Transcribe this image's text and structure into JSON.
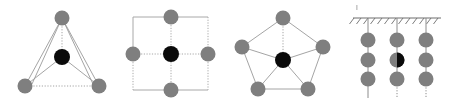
{
  "figure": {
    "title": "",
    "background_color": "#ffffff",
    "width": 449,
    "height": 106,
    "node_color": "#7f7f7f",
    "center_node_color": "#0a0a0a",
    "edge_color": "#9a9a9a",
    "panel_count": 4
  },
  "panels": [
    {
      "id": "panel-triangle",
      "label": "triangle-network",
      "shape": "triangle",
      "outer_node_count": 3,
      "center_node_count": 1,
      "origin_x": 8,
      "node_radius": 7.5,
      "center_radius": 8.0,
      "outer_nodes": [
        {
          "name": "apex",
          "x": 54,
          "y": 18
        },
        {
          "name": "bottom-left",
          "x": 17,
          "y": 86
        },
        {
          "name": "bottom-right",
          "x": 91,
          "y": 86
        }
      ],
      "center_node": {
        "name": "center",
        "x": 54,
        "y": 57
      },
      "solid_edges": [
        [
          54,
          18,
          17,
          86
        ],
        [
          54,
          18,
          91,
          86
        ],
        [
          54,
          18,
          54,
          57
        ],
        [
          54,
          57,
          17,
          86
        ],
        [
          54,
          57,
          91,
          86
        ]
      ],
      "dotted_edges": [
        [
          17,
          86,
          91,
          86
        ]
      ]
    },
    {
      "id": "panel-square",
      "label": "square-lattice-network",
      "shape": "square-grid",
      "outer_node_count": 4,
      "center_node_count": 1,
      "origin_x": 117,
      "node_radius": 7.5,
      "center_radius": 8.0,
      "outer_nodes": [
        {
          "name": "top",
          "x": 54,
          "y": 17
        },
        {
          "name": "left",
          "x": 16,
          "y": 54
        },
        {
          "name": "right",
          "x": 91,
          "y": 54
        },
        {
          "name": "bottom",
          "x": 54,
          "y": 90
        }
      ],
      "center_node": {
        "name": "center",
        "x": 54,
        "y": 54
      },
      "solid_edges": [
        [
          16,
          17,
          91,
          17
        ],
        [
          16,
          17,
          16,
          54
        ],
        [
          54,
          17,
          54,
          54
        ],
        [
          16,
          54,
          54,
          54
        ],
        [
          54,
          54,
          91,
          54
        ],
        [
          16,
          54,
          16,
          90
        ],
        [
          16,
          90,
          91,
          90
        ]
      ],
      "dotted_edges": [
        [
          91,
          17,
          91,
          54
        ],
        [
          91,
          54,
          91,
          90
        ],
        [
          54,
          54,
          54,
          90
        ],
        [
          16,
          90,
          91,
          90
        ],
        [
          16,
          54,
          16,
          90
        ]
      ]
    },
    {
      "id": "panel-pentagon",
      "label": "pentagon-network",
      "shape": "pentagon",
      "outer_node_count": 5,
      "center_node_count": 1,
      "origin_x": 230,
      "node_radius": 7.5,
      "center_radius": 8.0,
      "outer_nodes": [
        {
          "name": "top",
          "x": 53,
          "y": 18
        },
        {
          "name": "upper-left",
          "x": 12,
          "y": 47
        },
        {
          "name": "upper-right",
          "x": 93,
          "y": 47
        },
        {
          "name": "lower-left",
          "x": 28,
          "y": 89
        },
        {
          "name": "lower-right",
          "x": 78,
          "y": 89
        }
      ],
      "center_node": {
        "name": "center",
        "x": 53,
        "y": 60
      },
      "solid_edges": [
        [
          53,
          18,
          12,
          47
        ],
        [
          53,
          18,
          93,
          47
        ],
        [
          12,
          47,
          28,
          89
        ],
        [
          93,
          47,
          78,
          89
        ],
        [
          12,
          47,
          53,
          60
        ],
        [
          93,
          47,
          53,
          60
        ],
        [
          28,
          89,
          53,
          60
        ],
        [
          78,
          89,
          53,
          60
        ],
        [
          28,
          89,
          78,
          89
        ]
      ],
      "dotted_edges": [
        [
          53,
          18,
          53,
          60
        ]
      ]
    },
    {
      "id": "panel-suspended",
      "label": "suspended-chains-with-fixed-support",
      "shape": "hanging-chains",
      "origin_x": 345,
      "node_radius": 7.5,
      "column_count": 3,
      "nodes_per_column": 3,
      "support": {
        "name": "fixed-support-hatching",
        "line_y": 18,
        "line_x1": 8,
        "line_x2": 96,
        "hatch_count": 13,
        "hatch_length": 7
      },
      "columns": [
        {
          "name": "left-column",
          "x": 23,
          "dotted": false,
          "node_ys": [
            40,
            60,
            79
          ],
          "tail_y": 98
        },
        {
          "name": "center-column",
          "x": 52,
          "dotted": true,
          "node_ys": [
            40,
            60,
            79
          ],
          "tail_y": 98
        },
        {
          "name": "right-column",
          "x": 81,
          "dotted": true,
          "node_ys": [
            40,
            60,
            79
          ],
          "tail_y": 98
        }
      ],
      "half_filled_node": {
        "name": "half-black-node",
        "column": "center-column",
        "x": 52,
        "y": 60,
        "filled_side": "right"
      },
      "speck": {
        "name": "stray-mark",
        "x": 11,
        "y": 6,
        "width": 2,
        "height": 5
      }
    }
  ]
}
